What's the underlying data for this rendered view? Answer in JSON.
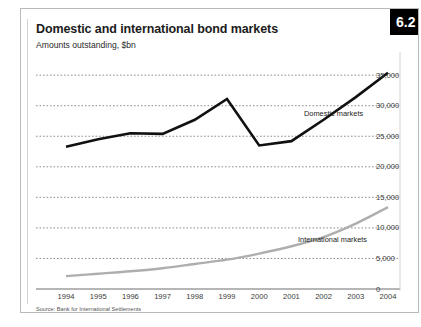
{
  "card": {
    "badge": "6.2",
    "title": "Domestic and international bond markets",
    "subtitle": "Amounts outstanding, $bn",
    "source": "Source: Bank for International Settlements"
  },
  "annotations": {
    "domestic_label": "Domestic markets",
    "international_label": "International markets"
  },
  "colors": {
    "domestic_line": "#111111",
    "international_line": "#aeaeae",
    "gridline": "#7a7a7a",
    "axis": "#6e6e6e",
    "badge_background": "#000000",
    "badge_text": "#ffffff",
    "card_border": "#b9b9b9"
  },
  "chart_data": {
    "type": "line",
    "title": "Domestic and international bond markets",
    "subtitle": "Amounts outstanding, $bn",
    "xlabel": "",
    "ylabel": "Amounts outstanding, $bn",
    "x": [
      "1994",
      "1995",
      "1996",
      "1997",
      "1998",
      "1999",
      "2000",
      "2001",
      "2002",
      "2003",
      "2004"
    ],
    "xtick_labels": [
      "1994",
      "1995",
      "1996",
      "1997",
      "1998",
      "1999",
      "2000",
      "2001",
      "2002",
      "2003",
      "2004"
    ],
    "ytick_labels": [
      "0",
      "5,000",
      "10,000",
      "15,000",
      "20,000",
      "25,000",
      "30,000",
      "35,000"
    ],
    "ytick_values": [
      0,
      5000,
      10000,
      15000,
      20000,
      25000,
      30000,
      35000
    ],
    "ylim": [
      0,
      36500
    ],
    "grid": true,
    "grid_style": "dotted-horizontal",
    "y_axis_position": "right",
    "legend": "inline-annotations",
    "series": [
      {
        "name": "Domestic markets",
        "color": "#111111",
        "values": [
          23300,
          24500,
          25500,
          25400,
          27700,
          31100,
          23500,
          24200,
          27700,
          31400,
          35400
        ]
      },
      {
        "name": "International markets",
        "color": "#aeaeae",
        "values": [
          2100,
          2500,
          2900,
          3400,
          4100,
          4800,
          5800,
          7000,
          8500,
          10700,
          13400
        ]
      }
    ]
  }
}
